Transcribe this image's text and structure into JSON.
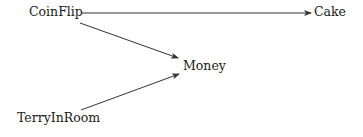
{
  "diagram": {
    "type": "directed-graph",
    "nodes": {
      "coinflip": {
        "label": "CoinFlip"
      },
      "cake": {
        "label": "Cake"
      },
      "money": {
        "label": "Money"
      },
      "terryinroom": {
        "label": "TerryInRoom"
      }
    },
    "edges": [
      {
        "from": "CoinFlip",
        "to": "Cake"
      },
      {
        "from": "CoinFlip",
        "to": "Money"
      },
      {
        "from": "TerryInRoom",
        "to": "Money"
      }
    ],
    "edge_color": "#333333"
  }
}
